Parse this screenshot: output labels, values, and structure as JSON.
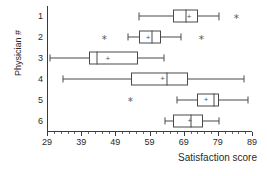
{
  "chart_data": {
    "type": "box",
    "title": "",
    "xlabel": "Satisfaction score",
    "ylabel": "Physician #",
    "orientation": "horizontal",
    "grid": false,
    "legend": "none",
    "xlim": [
      29,
      89
    ],
    "xticks": [
      29,
      39,
      49,
      59,
      69,
      79,
      89
    ],
    "xtick_labels": [
      "29",
      "39",
      "49",
      "59",
      "69",
      "79",
      "89"
    ],
    "minor_tick_step": 2,
    "categories": [
      "1",
      "2",
      "3",
      "4",
      "5",
      "6"
    ],
    "category_labels": [
      "1",
      "2",
      "3",
      "4",
      "5",
      "6"
    ],
    "boxes": [
      {
        "category": "1",
        "whisker_low": 56.0,
        "q1": 65.8,
        "median": 69.8,
        "q3": 73.2,
        "whisker_high": 79.4,
        "mean": 70.6,
        "outliers": [
          84.4
        ]
      },
      {
        "category": "2",
        "whisker_low": 52.7,
        "q1": 56.0,
        "median": 59.7,
        "q3": 62.4,
        "whisker_high": 68.3,
        "mean": 58.6,
        "outliers": [
          45.9,
          74.3
        ]
      },
      {
        "category": "3",
        "whisker_low": 29.8,
        "q1": 41.3,
        "median": 43.7,
        "q3": 55.7,
        "whisker_high": 63.3,
        "mean": 46.8,
        "outliers": []
      },
      {
        "category": "4",
        "whisker_low": 33.8,
        "q1": 53.6,
        "median": 64.0,
        "q3": 70.4,
        "whisker_high": 86.8,
        "mean": 62.8,
        "outliers": []
      },
      {
        "category": "5",
        "whisker_low": 67.0,
        "q1": 72.8,
        "median": 78.0,
        "q3": 79.2,
        "whisker_high": 87.8,
        "mean": 75.6,
        "outliers": [
          53.3
        ]
      },
      {
        "category": "6",
        "whisker_low": 63.6,
        "q1": 65.8,
        "median": 71.0,
        "q3": 74.6,
        "whisker_high": 79.3,
        "mean": 70.8,
        "outliers": []
      }
    ]
  },
  "axis": {
    "x_title": "Satisfaction score",
    "y_title": "Physician #"
  }
}
